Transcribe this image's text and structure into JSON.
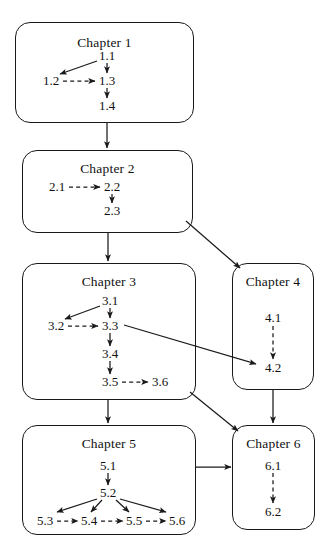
{
  "diagram": {
    "stroke_color": "#1a1a1a",
    "background_color": "#ffffff",
    "chapters": [
      {
        "id": "chapter-1",
        "label": "Chapter 1",
        "box": {
          "x": 15,
          "y": 22,
          "w": 179,
          "h": 101
        },
        "title_y": 12,
        "nodes": [
          {
            "id": "1.1",
            "label": "1.1",
            "x": 107,
            "y": 56
          },
          {
            "id": "1.2",
            "label": "1.2",
            "x": 51,
            "y": 81
          },
          {
            "id": "1.3",
            "label": "1.3",
            "x": 107,
            "y": 81
          },
          {
            "id": "1.4",
            "label": "1.4",
            "x": 107,
            "y": 106
          }
        ]
      },
      {
        "id": "chapter-2",
        "label": "Chapter 2",
        "box": {
          "x": 22,
          "y": 150,
          "w": 171,
          "h": 83
        },
        "title_y": 10,
        "nodes": [
          {
            "id": "2.1",
            "label": "2.1",
            "x": 57,
            "y": 187
          },
          {
            "id": "2.2",
            "label": "2.2",
            "x": 112,
            "y": 187
          },
          {
            "id": "2.3",
            "label": "2.3",
            "x": 112,
            "y": 211
          }
        ]
      },
      {
        "id": "chapter-3",
        "label": "Chapter 3",
        "box": {
          "x": 22,
          "y": 263,
          "w": 174,
          "h": 137
        },
        "title_y": 10,
        "nodes": [
          {
            "id": "3.1",
            "label": "3.1",
            "x": 110,
            "y": 301
          },
          {
            "id": "3.2",
            "label": "3.2",
            "x": 56,
            "y": 326
          },
          {
            "id": "3.3",
            "label": "3.3",
            "x": 110,
            "y": 326
          },
          {
            "id": "3.4",
            "label": "3.4",
            "x": 110,
            "y": 354
          },
          {
            "id": "3.5",
            "label": "3.5",
            "x": 110,
            "y": 382
          },
          {
            "id": "3.6",
            "label": "3.6",
            "x": 160,
            "y": 382
          }
        ]
      },
      {
        "id": "chapter-4",
        "label": "Chapter 4",
        "box": {
          "x": 232,
          "y": 263,
          "w": 82,
          "h": 127
        },
        "title_y": 10,
        "nodes": [
          {
            "id": "4.1",
            "label": "4.1",
            "x": 273,
            "y": 318
          },
          {
            "id": "4.2",
            "label": "4.2",
            "x": 273,
            "y": 368
          }
        ]
      },
      {
        "id": "chapter-5",
        "label": "Chapter 5",
        "box": {
          "x": 22,
          "y": 425,
          "w": 174,
          "h": 110
        },
        "title_y": 10,
        "nodes": [
          {
            "id": "5.1",
            "label": "5.1",
            "x": 108,
            "y": 466
          },
          {
            "id": "5.2",
            "label": "5.2",
            "x": 108,
            "y": 493
          },
          {
            "id": "5.3",
            "label": "5.3",
            "x": 45,
            "y": 521
          },
          {
            "id": "5.4",
            "label": "5.4",
            "x": 89,
            "y": 521
          },
          {
            "id": "5.5",
            "label": "5.5",
            "x": 134,
            "y": 521
          },
          {
            "id": "5.6",
            "label": "5.6",
            "x": 177,
            "y": 521
          }
        ]
      },
      {
        "id": "chapter-6",
        "label": "Chapter 6",
        "box": {
          "x": 232,
          "y": 425,
          "w": 83,
          "h": 105
        },
        "title_y": 10,
        "nodes": [
          {
            "id": "6.1",
            "label": "6.1",
            "x": 273,
            "y": 466
          },
          {
            "id": "6.2",
            "label": "6.2",
            "x": 273,
            "y": 512
          }
        ]
      }
    ],
    "edges": [
      {
        "id": "e-1_1-1_2",
        "from": "1.1",
        "to": "1.2",
        "style": "solid"
      },
      {
        "id": "e-1_2-1_3",
        "from": "1.2",
        "to": "1.3",
        "style": "dashed"
      },
      {
        "id": "e-1_1-1_3",
        "from": "1.1",
        "to": "1.3",
        "style": "solid"
      },
      {
        "id": "e-1_3-1_4",
        "from": "1.3",
        "to": "1.4",
        "style": "solid"
      },
      {
        "id": "e-ch1-ch2",
        "from": "Chapter 1",
        "to": "Chapter 2",
        "style": "solid"
      },
      {
        "id": "e-2_1-2_2",
        "from": "2.1",
        "to": "2.2",
        "style": "dashed"
      },
      {
        "id": "e-2_2-2_3",
        "from": "2.2",
        "to": "2.3",
        "style": "solid"
      },
      {
        "id": "e-ch2-ch3",
        "from": "Chapter 2",
        "to": "Chapter 3",
        "style": "solid"
      },
      {
        "id": "e-ch2-ch4",
        "from": "Chapter 2",
        "to": "Chapter 4",
        "style": "solid"
      },
      {
        "id": "e-3_1-3_2",
        "from": "3.1",
        "to": "3.2",
        "style": "solid"
      },
      {
        "id": "e-3_2-3_3",
        "from": "3.2",
        "to": "3.3",
        "style": "dashed"
      },
      {
        "id": "e-3_1-3_3",
        "from": "3.1",
        "to": "3.3",
        "style": "solid"
      },
      {
        "id": "e-3_3-3_4",
        "from": "3.3",
        "to": "3.4",
        "style": "solid"
      },
      {
        "id": "e-3_4-3_5",
        "from": "3.4",
        "to": "3.5",
        "style": "solid"
      },
      {
        "id": "e-3_5-3_6",
        "from": "3.5",
        "to": "3.6",
        "style": "dashed"
      },
      {
        "id": "e-3_3-4_2",
        "from": "3.3",
        "to": "4.2",
        "style": "solid"
      },
      {
        "id": "e-4_1-4_2",
        "from": "4.1",
        "to": "4.2",
        "style": "dashed"
      },
      {
        "id": "e-ch3-ch5",
        "from": "Chapter 3",
        "to": "Chapter 5",
        "style": "solid"
      },
      {
        "id": "e-ch3-ch6",
        "from": "Chapter 3",
        "to": "Chapter 6",
        "style": "solid"
      },
      {
        "id": "e-ch4-ch6",
        "from": "Chapter 4",
        "to": "Chapter 6",
        "style": "solid"
      },
      {
        "id": "e-5_1-5_2",
        "from": "5.1",
        "to": "5.2",
        "style": "solid"
      },
      {
        "id": "e-5_2-5_3",
        "from": "5.2",
        "to": "5.3",
        "style": "solid"
      },
      {
        "id": "e-5_2-5_4",
        "from": "5.2",
        "to": "5.4",
        "style": "solid"
      },
      {
        "id": "e-5_2-5_5",
        "from": "5.2",
        "to": "5.5",
        "style": "solid"
      },
      {
        "id": "e-5_2-5_6",
        "from": "5.2",
        "to": "5.6",
        "style": "solid"
      },
      {
        "id": "e-5_3-5_4",
        "from": "5.3",
        "to": "5.4",
        "style": "dashed"
      },
      {
        "id": "e-5_4-5_5",
        "from": "5.4",
        "to": "5.5",
        "style": "dashed"
      },
      {
        "id": "e-5_5-5_6",
        "from": "5.5",
        "to": "5.6",
        "style": "dashed"
      },
      {
        "id": "e-ch5-ch6",
        "from": "Chapter 5",
        "to": "Chapter 6",
        "style": "solid"
      },
      {
        "id": "e-6_1-6_2",
        "from": "6.1",
        "to": "6.2",
        "style": "dashed"
      }
    ]
  }
}
